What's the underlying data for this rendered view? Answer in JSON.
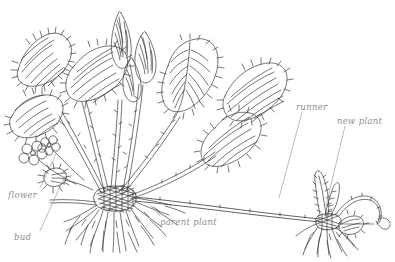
{
  "figure": {
    "type": "botanical-line-drawing",
    "background_color": "#ffffff",
    "ink_color": "#3a3a3a",
    "label_color": "#8e8e8e",
    "width": 395,
    "height": 262
  },
  "labels": [
    {
      "id": "flower",
      "text": "flower",
      "x": 8,
      "y": 190,
      "leader_to_x": 52,
      "leader_to_y": 152
    },
    {
      "id": "bud",
      "text": "bud",
      "x": 14,
      "y": 232,
      "leader_to_x": 57,
      "leader_to_y": 176
    },
    {
      "id": "parent",
      "text": "parent plant",
      "x": 160,
      "y": 217,
      "leader_to_x": 158,
      "leader_to_y": 203
    },
    {
      "id": "runner",
      "text": "runner",
      "x": 296,
      "y": 102,
      "leader_to_x": 277,
      "leader_to_y": 198
    },
    {
      "id": "new-plant",
      "text": "new plant",
      "x": 337,
      "y": 116,
      "leader_to_x": 325,
      "leader_to_y": 205
    }
  ],
  "parts": {
    "flower_count": 2,
    "bud_count": 1,
    "leaf_type": "trifoliate serrated",
    "parent_crown": "dense dark crown with fibrous radiating roots",
    "runner_description": "arching stolon from parent crown to daughter plantlet",
    "new_plant_description": "daughter plantlet with emerging folded leaves, small leaf and young roots"
  }
}
